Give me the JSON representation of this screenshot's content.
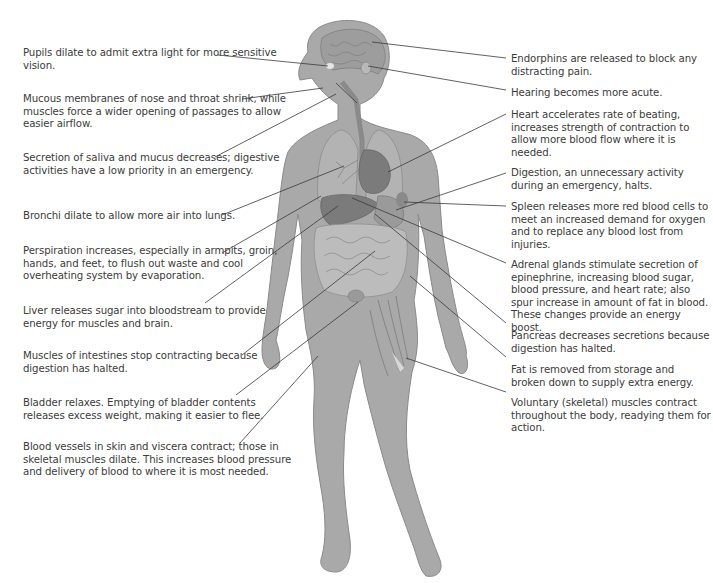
{
  "diagram": {
    "body_colors": {
      "skin": "#a9a9a9",
      "skin_outline": "#8a8a8a",
      "organ_dark": "#7b7b7b",
      "organ_mid": "#959595",
      "organ_light": "#bdbdbd",
      "leader_line": "#3a3a3a"
    }
  },
  "labels_left": [
    {
      "id": "pupils",
      "text": "Pupils dilate to admit extra light for more sensitive vision."
    },
    {
      "id": "mucous",
      "text": "Mucous membranes of nose and throat shrink, while muscles force a wider opening of passages to allow easier airflow."
    },
    {
      "id": "saliva",
      "text": "Secretion of saliva and mucus decreases; digestive activities have a low priority in an emergency."
    },
    {
      "id": "bronchi",
      "text": "Bronchi dilate to allow more air into lungs."
    },
    {
      "id": "perspiration",
      "text": "Perspiration increases, especially in armpits, groin, hands, and feet, to flush out waste and cool overheating system by evaporation."
    },
    {
      "id": "liver",
      "text": "Liver releases sugar into bloodstream to provide energy for muscles and brain."
    },
    {
      "id": "intestines",
      "text": "Muscles of intestines stop contracting because digestion has halted."
    },
    {
      "id": "bladder",
      "text": "Bladder relaxes. Emptying of bladder contents releases excess weight, making it easier to flee."
    },
    {
      "id": "blood-vessels",
      "text": "Blood vessels in skin and viscera contract; those in skeletal muscles dilate. This increases blood pressure and delivery of blood to where it is most needed."
    }
  ],
  "labels_right": [
    {
      "id": "endorphins",
      "text": "Endorphins are released to block any distracting pain."
    },
    {
      "id": "hearing",
      "text": "Hearing becomes more acute."
    },
    {
      "id": "heart",
      "text": "Heart accelerates rate of beating, increases strength of contraction to allow more blood flow where it is needed."
    },
    {
      "id": "digestion",
      "text": "Digestion, an unnecessary activity during an emergency, halts."
    },
    {
      "id": "spleen",
      "text": "Spleen releases more red blood cells to meet an increased demand for oxygen and to replace any blood lost from injuries."
    },
    {
      "id": "adrenal",
      "text": "Adrenal glands stimulate secretion of epinephrine, increasing blood sugar, blood pressure, and heart rate; also spur increase in amount of fat in blood. These changes provide an energy boost."
    },
    {
      "id": "pancreas",
      "text": "Pancreas decreases secretions because digestion has halted."
    },
    {
      "id": "fat",
      "text": "Fat is removed from storage and broken down to supply extra energy."
    },
    {
      "id": "muscles",
      "text": "Voluntary (skeletal) muscles contract throughout the body, readying them for action."
    }
  ]
}
